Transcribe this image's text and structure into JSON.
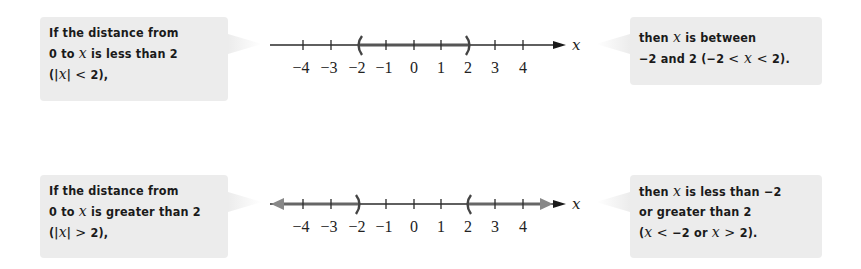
{
  "panels": [
    {
      "id": "less-than",
      "condition": {
        "lines": [
          "If the distance from",
          "0 to x is less than 2",
          "(|x| < 2),"
        ]
      },
      "conclusion": {
        "lines": [
          "then x is between",
          "-2 and 2 (-2 < x < 2)."
        ]
      },
      "number_line": {
        "axis_label": "x",
        "ticks": [
          "−4",
          "−3",
          "−2",
          "−1",
          "0",
          "1",
          "2",
          "3",
          "4"
        ],
        "shaded": "between",
        "open_left": "−2",
        "open_right": "2"
      }
    },
    {
      "id": "greater-than",
      "condition": {
        "lines": [
          "If the distance from",
          "0 to x is greater than 2",
          "(|x| > 2),"
        ]
      },
      "conclusion": {
        "lines": [
          "then x is less than −2",
          "or greater than 2",
          "(x < −2 or x > 2)."
        ]
      },
      "number_line": {
        "axis_label": "x",
        "ticks": [
          "−4",
          "−3",
          "−2",
          "−1",
          "0",
          "1",
          "2",
          "3",
          "4"
        ],
        "shaded": "outside",
        "open_left": "−2",
        "open_right": "2"
      }
    }
  ],
  "text": {
    "tl": {
      "a": "If the distance from",
      "b1": "0 to ",
      "bx": "x",
      "b2": " is less than 2",
      "c1": "(|",
      "cx": "x",
      "c2": "| ",
      "crel": "<",
      "c3": " 2),"
    },
    "tr": {
      "a1": "then ",
      "ax": "x",
      "a2": " is between",
      "b1": "−2 and 2 (−2 ",
      "brel1": "<",
      "bx": " x ",
      "brel2": "<",
      "b2": " 2)."
    },
    "bl": {
      "a": "If the distance from",
      "b1": "0 to ",
      "bx": "x",
      "b2": " is greater than 2",
      "c1": "(|",
      "cx": "x",
      "c2": "| ",
      "crel": ">",
      "c3": " 2),"
    },
    "br": {
      "a1": "then ",
      "ax": "x",
      "a2": " is less than −2",
      "b": "or greater than 2",
      "c1": "(",
      "cx1": "x",
      "crel1": " < ",
      "c2": "−2 or ",
      "cx2": "x",
      "crel2": " > ",
      "c3": "2)."
    }
  },
  "colors": {
    "box_bg": "#ececec",
    "axis": "#2a2a2a",
    "shade": "#555555",
    "text": "#1a1a1a"
  }
}
